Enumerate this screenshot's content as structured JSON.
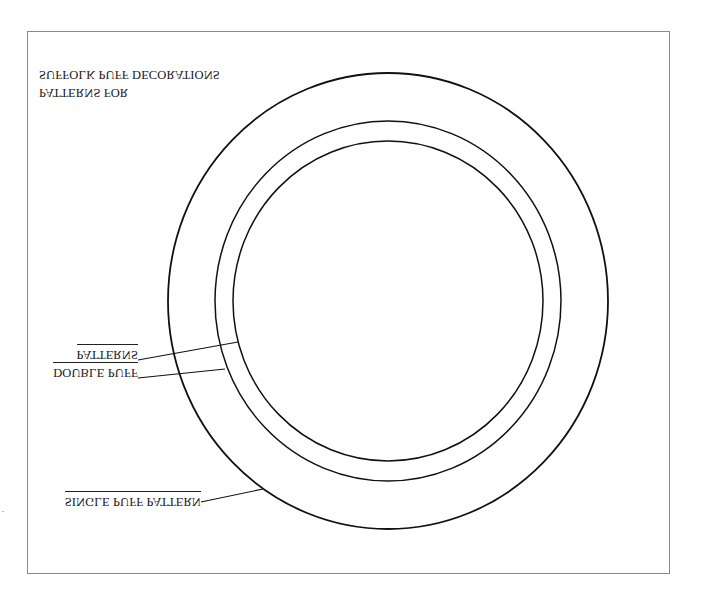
{
  "figure": {
    "title_lines": [
      "SUFFOLK PUFF DECORATIONS",
      "PATTERNS FOR"
    ],
    "text_orientation": "vertically-flipped",
    "labels": {
      "double_puff": [
        "PATTERNS",
        "DOUBLE PUFF"
      ],
      "single_puff": "SINGLE PUFF PATTERN"
    },
    "circles": [
      {
        "name": "outer",
        "cx": 388,
        "cy": 301,
        "rx": 220,
        "ry": 228
      },
      {
        "name": "middle",
        "cx": 388,
        "cy": 301,
        "rx": 173,
        "ry": 180
      },
      {
        "name": "inner",
        "cx": 388,
        "cy": 301,
        "rx": 155,
        "ry": 160
      }
    ],
    "stroke_color": "#111111",
    "frame_color": "#8a8a8a"
  }
}
